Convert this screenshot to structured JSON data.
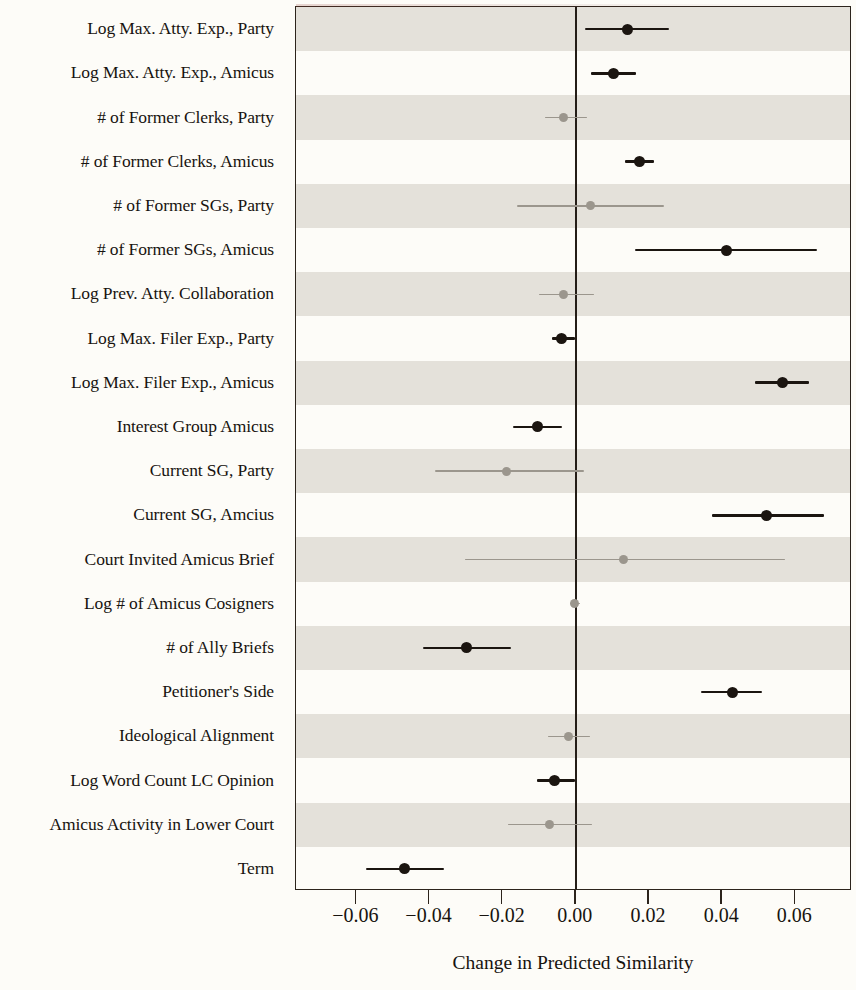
{
  "figure": {
    "xlabel": "Change in Predicted Similarity",
    "zero_line_value": "0.00",
    "dark_color": "#1b1510",
    "light_color": "#9b968d",
    "band_color": "#e4e1da",
    "panel_border_color": "#2c241c"
  },
  "axis": {
    "ticks": [
      "−0.06",
      "−0.04",
      "−0.02",
      "0.00",
      "0.02",
      "0.04",
      "0.06"
    ],
    "tick_values": [
      -0.06,
      -0.04,
      -0.02,
      0.0,
      0.02,
      0.04,
      0.06
    ],
    "xlim": [
      -0.0765,
      0.0755
    ]
  },
  "chart_data": {
    "type": "scatter",
    "title": "",
    "subtitle": "",
    "xlabel": "Change in Predicted Similarity",
    "ylabel": "",
    "xlim": [
      -0.0765,
      0.0755
    ],
    "grid": false,
    "legend": "none",
    "annotations": [
      "vertical reference line at x = 0.00"
    ],
    "categories": [
      "Log Max. Atty. Exp., Party",
      "Log Max. Atty. Exp., Amicus",
      "# of Former Clerks, Party",
      "# of Former Clerks, Amicus",
      "# of Former SGs, Party",
      "# of Former SGs, Amicus",
      "Log Prev. Atty. Collaboration",
      "Log Max. Filer Exp., Party",
      "Log Max. Filer Exp., Amicus",
      "Interest Group Amicus",
      "Current SG, Party",
      "Current SG, Amcius",
      "Court Invited Amicus Brief",
      "Log # of Amicus Cosigners",
      "# of Ally Briefs",
      "Petitioner's Side",
      "Ideological Alignment",
      "Log Word Count LC Opinion",
      "Amicus Activity in Lower Court",
      "Term"
    ],
    "estimates": [
      0.014,
      0.0104,
      -0.0033,
      0.0173,
      0.0041,
      0.0411,
      -0.0033,
      -0.0038,
      0.0564,
      -0.0104,
      -0.0189,
      0.0521,
      0.0129,
      -0.0003,
      -0.0299,
      0.0427,
      -0.0019,
      -0.0057,
      -0.0071,
      -0.0468
    ],
    "ci_low": [
      0.0025,
      0.0041,
      -0.0085,
      0.0134,
      -0.0162,
      0.0162,
      -0.0102,
      -0.0066,
      0.049,
      -0.0173,
      -0.0386,
      0.0373,
      -0.0304,
      -0.0017,
      -0.0419,
      0.0342,
      -0.0077,
      -0.0107,
      -0.0186,
      -0.0573
    ],
    "ci_high": [
      0.0255,
      0.0164,
      0.003,
      0.0214,
      0.0241,
      0.0658,
      0.0049,
      -0.0003,
      0.0638,
      -0.0038,
      0.0022,
      0.0679,
      0.0573,
      0.0011,
      -0.0178,
      0.051,
      0.0038,
      -0.0003,
      0.0044,
      -0.0359
    ],
    "significant": [
      true,
      true,
      false,
      true,
      false,
      true,
      false,
      true,
      true,
      true,
      false,
      true,
      false,
      false,
      true,
      true,
      false,
      true,
      false,
      true
    ]
  }
}
